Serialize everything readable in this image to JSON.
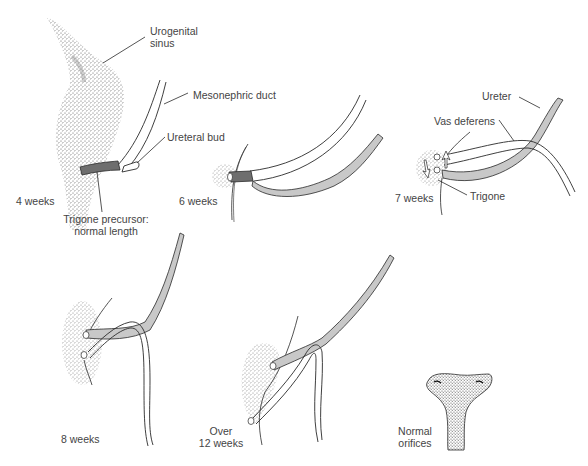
{
  "labels": {
    "urogenital_sinus_line1": "Urogenital",
    "urogenital_sinus_line2": "sinus",
    "mesonephric_duct": "Mesonephric duct",
    "ureteral_bud": "Ureteral bud",
    "trigone_precursor_line1": "Trigone precursor:",
    "trigone_precursor_line2": "normal length",
    "ureter": "Ureter",
    "vas_deferens": "Vas deferens",
    "trigone": "Trigone",
    "normal_orifices_line1": "Normal",
    "normal_orifices_line2": "orifices"
  },
  "stages": [
    {
      "label": "4 weeks"
    },
    {
      "label": "6 weeks"
    },
    {
      "label": "7 weeks"
    },
    {
      "label": "8 weeks"
    },
    {
      "label_line1": "Over",
      "label_line2": "12 weeks"
    }
  ],
  "colors": {
    "trigone_dark": "#6e6e6e",
    "ureter_gray": "#c8c8c8",
    "outline": "#2a2a2a",
    "stipple": "#555555"
  }
}
